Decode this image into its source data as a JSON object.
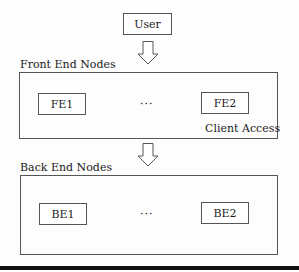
{
  "user": {
    "label": "User"
  },
  "frontend": {
    "title": "Front End Nodes",
    "nodes": [
      {
        "label": "FE1"
      },
      {
        "label": "FE2"
      }
    ],
    "ellipsis": "···",
    "note": "Client Access"
  },
  "backend": {
    "title": "Back End Nodes",
    "nodes": [
      {
        "label": "BE1"
      },
      {
        "label": "BE2"
      }
    ],
    "ellipsis": "···"
  },
  "arrows": [
    {
      "from": "User",
      "to": "Front End Nodes",
      "icon": "down-arrow-icon"
    },
    {
      "from": "Front End Nodes",
      "to": "Back End Nodes",
      "icon": "down-arrow-icon"
    }
  ]
}
